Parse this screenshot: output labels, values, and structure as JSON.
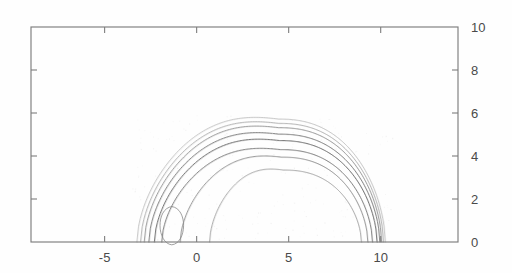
{
  "figure": {
    "background_color": "#fefefe",
    "axis_color": "#7d7d7d",
    "label_color": "#4a4a4a"
  },
  "axes": {
    "x_tick_labels": [
      "-5",
      "0",
      "5",
      "10"
    ],
    "y_tick_labels": [
      "10",
      "8",
      "6",
      "4",
      "2",
      "0"
    ],
    "y_labels_side": "right"
  },
  "chart_data": {
    "type": "line",
    "subtype": "contour",
    "title": "",
    "xlabel": "",
    "ylabel": "",
    "xlim": [
      -9.0,
      14.2
    ],
    "ylim": [
      0,
      10
    ],
    "x_ticks": [
      -5,
      0,
      5,
      10
    ],
    "y_ticks": [
      0,
      2,
      4,
      6,
      8,
      10
    ],
    "grid": false,
    "legend": null,
    "series": [
      {
        "name": "contour-1-outermost",
        "stroke": "#b9b9b9",
        "width": 0.75,
        "x_start": -3.25,
        "x_end": 10.25,
        "peak_x": 4.45,
        "peak_y": 5.72
      },
      {
        "name": "contour-2",
        "stroke": "#a8a8a8",
        "width": 0.8,
        "x_start": -3.05,
        "x_end": 10.15,
        "peak_x": 4.45,
        "peak_y": 5.52
      },
      {
        "name": "contour-3",
        "stroke": "#8f8f8f",
        "width": 0.85,
        "x_start": -2.85,
        "x_end": 10.05,
        "peak_x": 4.45,
        "peak_y": 5.32
      },
      {
        "name": "contour-4",
        "stroke": "#7a7a7a",
        "width": 0.9,
        "x_start": -2.6,
        "x_end": 9.95,
        "peak_x": 4.45,
        "peak_y": 5.02
      },
      {
        "name": "contour-5",
        "stroke": "#6e6e6e",
        "width": 0.95,
        "x_start": -2.3,
        "x_end": 9.8,
        "peak_x": 4.5,
        "peak_y": 4.72
      },
      {
        "name": "contour-6",
        "stroke": "#7a7a7a",
        "width": 0.9,
        "x_start": -1.9,
        "x_end": 9.55,
        "peak_x": 4.55,
        "peak_y": 4.3
      },
      {
        "name": "contour-7",
        "stroke": "#8a8a8a",
        "width": 0.85,
        "x_start": -0.9,
        "x_end": 9.3,
        "peak_x": 4.6,
        "peak_y": 3.95
      },
      {
        "name": "contour-8-innermost",
        "stroke": "#9c9c9c",
        "width": 0.8,
        "x_start": 0.7,
        "x_end": 8.95,
        "peak_x": 4.7,
        "peak_y": 3.35
      },
      {
        "name": "contour-loop-small",
        "stroke": "#8a8a8a",
        "width": 0.85,
        "closed": true,
        "center_x": -1.35,
        "center_y": 0.55,
        "half_width": 0.78,
        "half_height": 1.1
      }
    ]
  }
}
